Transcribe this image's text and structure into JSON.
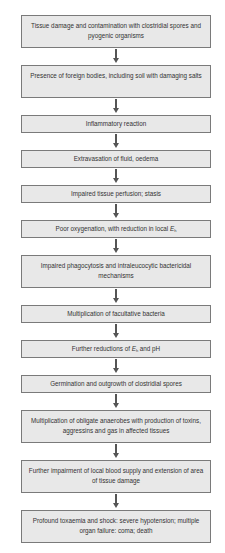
{
  "diagram": {
    "type": "flowchart",
    "direction": "top-to-bottom",
    "steps": [
      {
        "text": "Tissue damage and contamination with clostridial spores and pyogenic organisms"
      },
      {
        "text": "Presence of foreign bodies, including soil with damaging salts"
      },
      {
        "text": "Inflammatory reaction"
      },
      {
        "text": "Extravasation of fluid, oedema"
      },
      {
        "text": "Impaired tissue perfusion; stasis"
      },
      {
        "text_before": "Poor oxygenation, with reduction in local ",
        "var": "E",
        "sub": "h",
        "text_after": ""
      },
      {
        "text": "Impaired phagocytosis and intraleucocytic bactericidal mechanisms"
      },
      {
        "text": "Multiplication of facultative bacteria"
      },
      {
        "text_before": "Further reductions of ",
        "var": "E",
        "sub": "h",
        "text_after": " and pH"
      },
      {
        "text": "Germination and outgrowth of clostridial spores"
      },
      {
        "text": "Multiplication of obligate anaerobes with production of toxins, aggressins and gas in affected tissues"
      },
      {
        "text": "Further impairment of local blood supply and extension of area of tissue damage"
      },
      {
        "text": "Profound toxaemia and shock: severe hypotension; multiple organ failure: coma; death"
      }
    ],
    "colors": {
      "box_fill": "#e8e8e8",
      "box_border": "#7a7a7a",
      "arrow": "#555555"
    }
  }
}
